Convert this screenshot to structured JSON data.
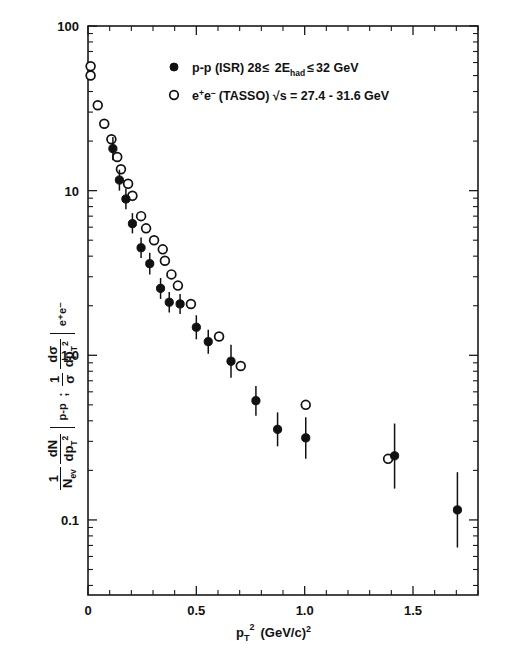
{
  "figure": {
    "background": "#ffffff",
    "ink_color": "#111111"
  },
  "chart_data": {
    "type": "scatter",
    "title": "",
    "subtitle": "",
    "xlabel": "p_T^2  (GeV/c)^2",
    "ylabel": "1/N_ev dN/dp_T^2 |_{p-p}  ;  1/sigma dsigma/dp_T^2 |_{e+e-}",
    "xlim": [
      0,
      1.8
    ],
    "ylim": [
      0.035,
      100
    ],
    "yscale": "log",
    "xscale": "linear",
    "grid": false,
    "legend_position": "top-right-inside",
    "xticks_major": [
      0,
      0.5,
      1.0,
      1.5
    ],
    "xticklabels": [
      "0",
      "0.5",
      "1.0",
      "1.5"
    ],
    "xticks_minor_step": 0.1,
    "yticks_major": [
      100,
      10,
      1.0,
      0.1
    ],
    "yticklabels": [
      "100",
      "10",
      "1.0",
      "0.1"
    ],
    "series": [
      {
        "name": "p-p (ISR)  28<= 2E_had <= 32 GeV",
        "marker": "filled-circle",
        "marker_color": "#111111",
        "has_error_bars": true,
        "points": [
          {
            "x": 0.115,
            "y": 18.0,
            "yerr_lo": 15.3,
            "yerr_hi": 21.2
          },
          {
            "x": 0.145,
            "y": 11.6,
            "yerr_lo": 10.0,
            "yerr_hi": 13.4
          },
          {
            "x": 0.175,
            "y": 8.9,
            "yerr_lo": 7.7,
            "yerr_hi": 10.3
          },
          {
            "x": 0.205,
            "y": 6.3,
            "yerr_lo": 5.5,
            "yerr_hi": 7.3
          },
          {
            "x": 0.245,
            "y": 4.5,
            "yerr_lo": 3.9,
            "yerr_hi": 5.2
          },
          {
            "x": 0.285,
            "y": 3.6,
            "yerr_lo": 3.1,
            "yerr_hi": 4.2
          },
          {
            "x": 0.335,
            "y": 2.55,
            "yerr_lo": 2.2,
            "yerr_hi": 2.95
          },
          {
            "x": 0.375,
            "y": 2.1,
            "yerr_lo": 1.82,
            "yerr_hi": 2.42
          },
          {
            "x": 0.425,
            "y": 2.05,
            "yerr_lo": 1.78,
            "yerr_hi": 2.36
          },
          {
            "x": 0.5,
            "y": 1.48,
            "yerr_lo": 1.25,
            "yerr_hi": 1.75
          },
          {
            "x": 0.555,
            "y": 1.21,
            "yerr_lo": 1.02,
            "yerr_hi": 1.43
          },
          {
            "x": 0.66,
            "y": 0.92,
            "yerr_lo": 0.73,
            "yerr_hi": 1.16
          },
          {
            "x": 0.775,
            "y": 0.53,
            "yerr_lo": 0.43,
            "yerr_hi": 0.65
          },
          {
            "x": 0.875,
            "y": 0.355,
            "yerr_lo": 0.28,
            "yerr_hi": 0.45
          },
          {
            "x": 1.005,
            "y": 0.315,
            "yerr_lo": 0.235,
            "yerr_hi": 0.42
          },
          {
            "x": 1.415,
            "y": 0.245,
            "yerr_lo": 0.155,
            "yerr_hi": 0.385
          },
          {
            "x": 1.705,
            "y": 0.115,
            "yerr_lo": 0.068,
            "yerr_hi": 0.195
          }
        ]
      },
      {
        "name": "e+e- (TASSO)  sqrt(s) = 27.4 - 31.6 GeV",
        "marker": "open-circle",
        "marker_color": "#ffffff",
        "has_error_bars": false,
        "points": [
          {
            "x": 0.012,
            "y": 57.0
          },
          {
            "x": 0.012,
            "y": 50.0
          },
          {
            "x": 0.045,
            "y": 33.0
          },
          {
            "x": 0.075,
            "y": 25.5
          },
          {
            "x": 0.108,
            "y": 20.5
          },
          {
            "x": 0.135,
            "y": 16.0
          },
          {
            "x": 0.152,
            "y": 13.5
          },
          {
            "x": 0.185,
            "y": 11.0
          },
          {
            "x": 0.205,
            "y": 9.3
          },
          {
            "x": 0.245,
            "y": 7.0
          },
          {
            "x": 0.268,
            "y": 5.9
          },
          {
            "x": 0.305,
            "y": 5.0
          },
          {
            "x": 0.345,
            "y": 4.4
          },
          {
            "x": 0.355,
            "y": 3.75
          },
          {
            "x": 0.385,
            "y": 3.1
          },
          {
            "x": 0.415,
            "y": 2.65
          },
          {
            "x": 0.475,
            "y": 2.05
          },
          {
            "x": 0.605,
            "y": 1.3
          },
          {
            "x": 0.705,
            "y": 0.86
          },
          {
            "x": 1.005,
            "y": 0.5
          },
          {
            "x": 1.385,
            "y": 0.235
          }
        ]
      }
    ],
    "legend_entries": [
      {
        "marker": "filled-circle",
        "text_main": "p-p  (ISR)   28",
        "text_le1": "≤",
        "text_2e": " 2E",
        "text_sub": "had",
        "text_le2": " ≤",
        "text_tail": " 32 GeV"
      },
      {
        "marker": "open-circle",
        "text_main": "e",
        "text_sup1": "+",
        "text_e2": "e",
        "text_sup2": "−",
        "text_tail": "  (TASSO)  √s = 27.4 - 31.6  GeV"
      }
    ]
  },
  "ylabel_parts": {
    "term1_num": "1",
    "term1_den": "N",
    "term1_den_sub": "ev",
    "term2_num": "dN",
    "term2_den": "dp",
    "term2_den_sub": "T",
    "term2_den_sup": "2",
    "term2_bar_label": "p-p",
    "separator": ";",
    "term3_num": "1",
    "term3_den": "σ",
    "term4_num": "dσ",
    "term4_den": "dp",
    "term4_den_sub": "T",
    "term4_den_sup": "2",
    "term4_bar_label": "e⁺e⁻"
  },
  "xlabel_parts": {
    "p": "p",
    "sub": "T",
    "sup": "2",
    "units_open": "(GeV/c)",
    "units_sup": "2"
  }
}
